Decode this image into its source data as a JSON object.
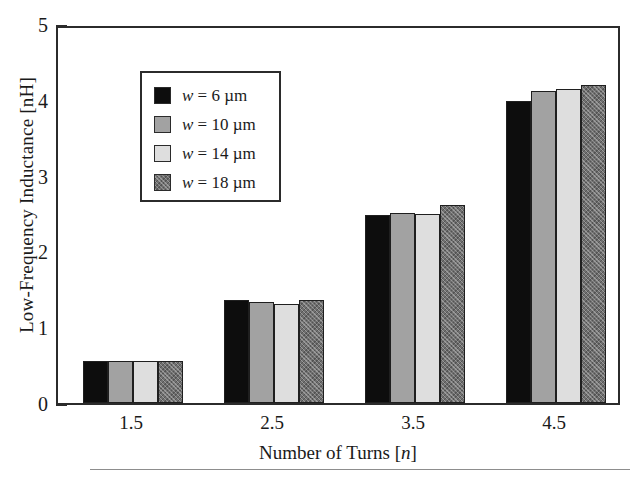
{
  "chart_data": {
    "type": "bar",
    "title": "",
    "xlabel": "Number of Turns [n]",
    "ylabel": "Low-Frequency Inductance [nH]",
    "categories": [
      "1.5",
      "2.5",
      "3.5",
      "4.5"
    ],
    "series": [
      {
        "name": "w = 6 µm",
        "values": [
          0.55,
          1.36,
          2.48,
          3.99
        ]
      },
      {
        "name": "w = 10 µm",
        "values": [
          0.55,
          1.33,
          2.51,
          4.12
        ]
      },
      {
        "name": "w = 14 µm",
        "values": [
          0.55,
          1.31,
          2.49,
          4.14
        ]
      },
      {
        "name": "w = 18 µm",
        "values": [
          0.56,
          1.36,
          2.61,
          4.19
        ]
      }
    ],
    "ylim": [
      0,
      5
    ],
    "ytick_labels": [
      "0",
      "1",
      "2",
      "3",
      "4",
      "5"
    ],
    "ytick_values": [
      0,
      1,
      2,
      3,
      4,
      5
    ],
    "yminor_step": 0.2,
    "xtick_labels": [
      "1.5",
      "2.5",
      "3.5",
      "4.5"
    ],
    "grid": false,
    "legend_position": "upper-left",
    "series_colors": [
      "#0d0d0d",
      "#a2a2a2",
      "#dedede",
      "#6f6f6f"
    ]
  },
  "axes": {
    "y_title": "Low-Frequency Inductance [nH]",
    "x_title_prefix": "Number of Turns [",
    "x_title_var": "n",
    "x_title_suffix": "]",
    "y_labels": [
      "5",
      "4",
      "3",
      "2",
      "1",
      "0"
    ],
    "x_labels": [
      "1.5",
      "2.5",
      "3.5",
      "4.5"
    ]
  },
  "legend": {
    "entries": [
      {
        "var": "w",
        "eq": "=",
        "value": "6",
        "unit": "µm"
      },
      {
        "var": "w",
        "eq": "=",
        "value": "10",
        "unit": "µm"
      },
      {
        "var": "w",
        "eq": "=",
        "value": "14",
        "unit": "µm"
      },
      {
        "var": "w",
        "eq": "=",
        "value": "18",
        "unit": "µm"
      }
    ]
  }
}
